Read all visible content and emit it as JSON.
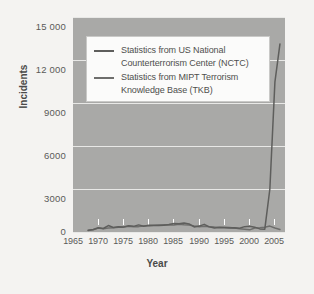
{
  "figure": {
    "background_color": "#f4f3f1",
    "plot_background_color": "#a9a9a7",
    "gridline_color": "#e8e8e6"
  },
  "axis": {
    "y_title": "Incidents",
    "x_title": "Year"
  },
  "legend": {
    "entries": [
      {
        "label": "Statistics from US National Counterterrorism Center (NCTC)",
        "color": "#5e5e5c"
      },
      {
        "label": "Statistics from MIPT Terrorism Knowledge Base (TKB)",
        "color": "#6e6e6c"
      }
    ]
  },
  "chart_data": {
    "type": "line",
    "title": "",
    "xlabel": "Year",
    "ylabel": "Incidents",
    "xlim": [
      1965,
      2007
    ],
    "ylim": [
      0,
      16000
    ],
    "xticks": [
      1965,
      1970,
      1975,
      1980,
      1985,
      1990,
      1995,
      2000,
      2005
    ],
    "xtick_labels": [
      "1965",
      "1970",
      "1975",
      "1980",
      "1985",
      "1990",
      "1995",
      "2000",
      "2005"
    ],
    "yticks": [
      0,
      3000,
      6000,
      9000,
      12000,
      15000
    ],
    "ytick_labels": [
      "0",
      "3000",
      "6000",
      "9000",
      "12 000",
      "15 000"
    ],
    "grid": "horizontal",
    "legend_position": "upper-left-inside",
    "series": [
      {
        "name": "Statistics from US National Counterterrorism Center (NCTC)",
        "color": "#5e5e5c",
        "x": [
          1968,
          1969,
          1970,
          1971,
          1972,
          1973,
          1974,
          1975,
          1976,
          1977,
          1978,
          1979,
          1980,
          1981,
          1982,
          1983,
          1984,
          1985,
          1986,
          1987,
          1988,
          1989,
          1990,
          1991,
          1992,
          1993,
          1994,
          1995,
          1996,
          1997,
          1998,
          1999,
          2000,
          2001,
          2002,
          2003,
          2004,
          2005,
          2006
        ],
        "values": [
          130,
          180,
          310,
          260,
          480,
          340,
          390,
          380,
          460,
          420,
          530,
          430,
          500,
          490,
          490,
          500,
          560,
          640,
          610,
          670,
          600,
          380,
          440,
          570,
          380,
          300,
          330,
          320,
          300,
          320,
          280,
          400,
          430,
          360,
          230,
          210,
          3200,
          11150,
          14000
        ]
      },
      {
        "name": "Statistics from MIPT Terrorism Knowledge Base (TKB)",
        "color": "#6e6e6c",
        "x": [
          1968,
          1969,
          1970,
          1971,
          1972,
          1973,
          1974,
          1975,
          1976,
          1977,
          1978,
          1979,
          1980,
          1981,
          1982,
          1983,
          1984,
          1985,
          1986,
          1987,
          1988,
          1989,
          1990,
          1991,
          1992,
          1993,
          1994,
          1995,
          1996,
          1997,
          1998,
          1999,
          2000,
          2001,
          2002,
          2003,
          2004,
          2005,
          2006
        ],
        "values": [
          120,
          160,
          290,
          240,
          300,
          320,
          360,
          350,
          420,
          390,
          400,
          450,
          470,
          500,
          520,
          540,
          520,
          530,
          570,
          540,
          520,
          440,
          400,
          420,
          400,
          370,
          350,
          360,
          330,
          290,
          240,
          200,
          160,
          300,
          320,
          360,
          440,
          300,
          180
        ]
      }
    ]
  }
}
